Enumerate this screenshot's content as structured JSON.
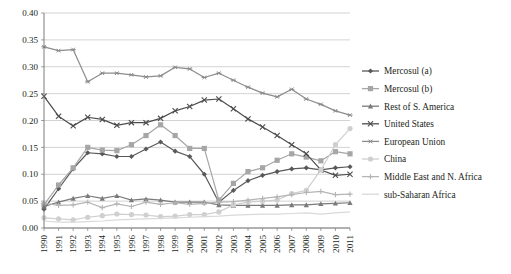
{
  "chart_data": {
    "type": "line",
    "title": "",
    "subtitle": "",
    "xlabel": "",
    "ylabel": "",
    "grid": true,
    "legend_position": "right",
    "ylim": [
      0.0,
      0.4
    ],
    "yticks": [
      "0.00",
      "0.05",
      "0.10",
      "0.15",
      "0.20",
      "0.25",
      "0.30",
      "0.35",
      "0.40"
    ],
    "ytick_values": [
      0.0,
      0.05,
      0.1,
      0.15,
      0.2,
      0.25,
      0.3,
      0.35,
      0.4
    ],
    "categories": [
      "1990",
      "1991",
      "1992",
      "1993",
      "1994",
      "1995",
      "1996",
      "1997",
      "1998",
      "1999",
      "2000",
      "2001",
      "2002",
      "2003",
      "2004",
      "2005",
      "2006",
      "2007",
      "2008",
      "2009",
      "2010",
      "2011"
    ],
    "series": [
      {
        "name": "Mercosul (a)",
        "marker": "diamond",
        "color": "#595959",
        "values": [
          0.035,
          0.073,
          0.11,
          0.14,
          0.138,
          0.133,
          0.133,
          0.147,
          0.16,
          0.143,
          0.133,
          0.1,
          0.048,
          0.07,
          0.088,
          0.098,
          0.105,
          0.11,
          0.112,
          0.108,
          0.112,
          0.114
        ]
      },
      {
        "name": "Mercosul (b)",
        "marker": "square",
        "color": "#a6a6a6",
        "values": [
          0.043,
          0.08,
          0.112,
          0.15,
          0.145,
          0.144,
          0.155,
          0.172,
          0.192,
          0.172,
          0.148,
          0.148,
          0.052,
          0.083,
          0.105,
          0.112,
          0.126,
          0.138,
          0.132,
          0.125,
          0.142,
          0.138
        ]
      },
      {
        "name": "Rest of S. America",
        "marker": "triangle",
        "color": "#7a7a7a",
        "values": [
          0.04,
          0.048,
          0.055,
          0.06,
          0.055,
          0.06,
          0.052,
          0.054,
          0.052,
          0.048,
          0.048,
          0.048,
          0.043,
          0.042,
          0.042,
          0.042,
          0.042,
          0.043,
          0.043,
          0.045,
          0.046,
          0.047
        ]
      },
      {
        "name": "United States",
        "marker": "x",
        "color": "#4d4d4d",
        "values": [
          0.245,
          0.208,
          0.19,
          0.206,
          0.202,
          0.191,
          0.196,
          0.196,
          0.204,
          0.218,
          0.226,
          0.238,
          0.24,
          0.222,
          0.203,
          0.188,
          0.172,
          0.155,
          0.138,
          0.108,
          0.098,
          0.1
        ]
      },
      {
        "name": "European Union",
        "marker": "asterisk",
        "color": "#8c8c8c",
        "values": [
          0.337,
          0.33,
          0.332,
          0.272,
          0.288,
          0.288,
          0.285,
          0.281,
          0.283,
          0.299,
          0.296,
          0.28,
          0.288,
          0.275,
          0.262,
          0.251,
          0.244,
          0.258,
          0.24,
          0.23,
          0.218,
          0.21
        ]
      },
      {
        "name": "China",
        "marker": "circle",
        "color": "#cfcfcf",
        "values": [
          0.019,
          0.017,
          0.015,
          0.02,
          0.023,
          0.026,
          0.025,
          0.024,
          0.021,
          0.022,
          0.025,
          0.025,
          0.03,
          0.043,
          0.048,
          0.05,
          0.052,
          0.064,
          0.07,
          0.108,
          0.155,
          0.185
        ]
      },
      {
        "name": "Middle East and N. Africa",
        "marker": "plus",
        "color": "#b5b5b5",
        "values": [
          0.046,
          0.042,
          0.043,
          0.048,
          0.038,
          0.045,
          0.04,
          0.048,
          0.044,
          0.047,
          0.044,
          0.046,
          0.048,
          0.049,
          0.052,
          0.055,
          0.058,
          0.062,
          0.066,
          0.068,
          0.062,
          0.063
        ]
      },
      {
        "name": "sub-Saharan Africa",
        "marker": "none",
        "color": "#d9d9d9",
        "values": [
          0.013,
          0.011,
          0.011,
          0.012,
          0.013,
          0.015,
          0.016,
          0.017,
          0.018,
          0.019,
          0.02,
          0.021,
          0.022,
          0.024,
          0.025,
          0.026,
          0.026,
          0.027,
          0.028,
          0.026,
          0.028,
          0.03
        ]
      }
    ]
  },
  "legend": {
    "items": [
      {
        "label": "Mercosul (a)"
      },
      {
        "label": "Mercosul (b)"
      },
      {
        "label": "Rest of S. America"
      },
      {
        "label": "United States"
      },
      {
        "label": "European Union"
      },
      {
        "label": "China"
      },
      {
        "label": "Middle East and N. Africa"
      },
      {
        "label": "sub-Saharan Africa"
      }
    ]
  }
}
